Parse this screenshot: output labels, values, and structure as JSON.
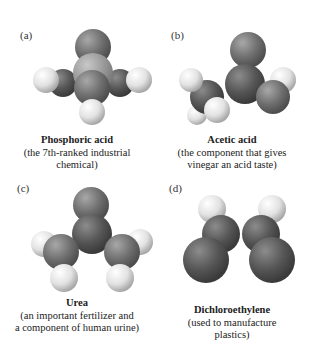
{
  "panels": [
    {
      "label": "(a)",
      "name": "Phosphoric acid",
      "desc_line1": "(the 7th-ranked industrial",
      "desc_line2": "chemical)"
    },
    {
      "label": "(b)",
      "name": "Acetic acid",
      "desc_line1": "(the component that gives",
      "desc_line2": "vinegar an acid taste)"
    },
    {
      "label": "(c)",
      "name": "Urea",
      "desc_line1": "(an important fertilizer and",
      "desc_line2": "a component of human urine)"
    },
    {
      "label": "(d)",
      "name": "Dichloroethylene",
      "desc_line1": "(used to manufacture",
      "desc_line2": "plastics)"
    }
  ],
  "colors": {
    "dark_atom": "#5a5a5a",
    "mid_atom": "#8a8a8a",
    "light_atom": "#e8e8e8",
    "phosphorus": "#9a9a9a"
  }
}
